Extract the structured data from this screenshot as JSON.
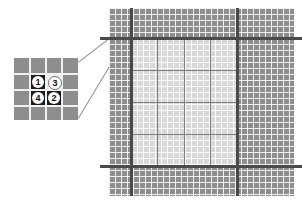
{
  "figure": {
    "type": "diagram"
  },
  "inset": {
    "name": "magnified-cell-detail",
    "grid": {
      "columns": 4,
      "rows": 4,
      "cell_size_px": 15
    },
    "background_color": "#8e8e8e",
    "gridline_color": "#f2f2f2",
    "highlighted_cells": [
      {
        "id": "cell-1",
        "col": 1,
        "row": 1,
        "fill": "dark",
        "color": "#1d1d1d"
      },
      {
        "id": "cell-3",
        "col": 2,
        "row": 1,
        "fill": "light",
        "color": "#efefef"
      },
      {
        "id": "cell-4",
        "col": 1,
        "row": 2,
        "fill": "dark",
        "color": "#1d1d1d"
      },
      {
        "id": "cell-2",
        "col": 2,
        "row": 2,
        "fill": "dark",
        "color": "#1d1d1d"
      }
    ],
    "markers": [
      {
        "label": "1",
        "col": 1,
        "row": 1,
        "style": "on-dark"
      },
      {
        "label": "3",
        "col": 2,
        "row": 1,
        "style": "on-light"
      },
      {
        "label": "4",
        "col": 1,
        "row": 2,
        "style": "on-dark"
      },
      {
        "label": "2",
        "col": 2,
        "row": 2,
        "style": "on-dark"
      }
    ]
  },
  "callout": {
    "name": "magnifier-callout",
    "line_color": "#8c8c8c",
    "lines": [
      {
        "id": "upper",
        "x1": 78,
        "y1": 62,
        "x2": 109,
        "y2": 38
      },
      {
        "id": "lower",
        "x1": 78,
        "y1": 118,
        "x2": 109,
        "y2": 62
      }
    ]
  },
  "mesh": {
    "name": "structured-mesh",
    "outer_band_color": "#8e8e8e",
    "inner_plate_color": "#d8d8d8",
    "fine_gridline_color": "#ffffff",
    "medium_gridline_color": "#7e7e7e",
    "heavy_line_color": "#4a4a4a",
    "fine_cell_px": 6,
    "heavy_vertical_x": [
      22,
      128
    ],
    "heavy_horizontal_y": [
      30,
      158
    ],
    "inner_plate": {
      "left": 22,
      "top": 30,
      "width": 106,
      "height": 128
    },
    "inner_blocks": {
      "columns": 4,
      "rows": 4
    }
  }
}
